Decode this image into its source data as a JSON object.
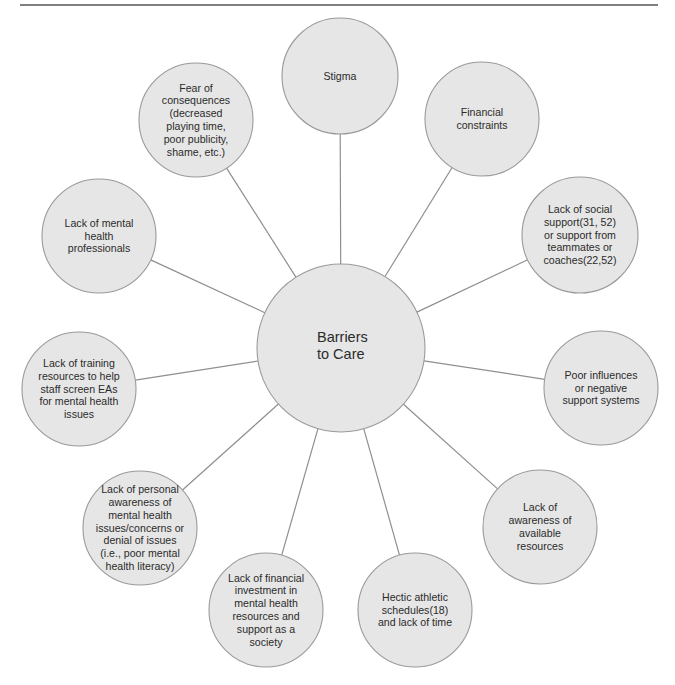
{
  "diagram": {
    "type": "hub-and-spoke",
    "colors": {
      "node_fill": "#e6e6e6",
      "node_stroke": "#9a9a9a",
      "connector": "#8f8f8f",
      "text": "#2b2b2b",
      "rule": "#555555"
    },
    "center": {
      "label_lines": [
        "Barriers",
        "to Care"
      ],
      "cx": 341,
      "cy": 348,
      "r": 84
    },
    "nodes": [
      {
        "id": "stigma",
        "lines": [
          "Stigma"
        ],
        "cx": 340,
        "cy": 76,
        "r": 58
      },
      {
        "id": "financial-constraints",
        "lines": [
          "Financial",
          "constraints"
        ],
        "cx": 482,
        "cy": 119,
        "r": 57
      },
      {
        "id": "social-support",
        "lines": [
          "Lack of social",
          "support(31, 52)",
          "or support from",
          "teammates or",
          "coaches(22,52)"
        ],
        "cx": 580,
        "cy": 235,
        "r": 58
      },
      {
        "id": "poor-influences",
        "lines": [
          "Poor influences",
          "or negative",
          "support systems"
        ],
        "cx": 601,
        "cy": 388,
        "r": 57
      },
      {
        "id": "awareness-resources",
        "lines": [
          "Lack of",
          "awareness of",
          "available",
          "resources"
        ],
        "cx": 540,
        "cy": 527,
        "r": 57
      },
      {
        "id": "hectic-schedules",
        "lines": [
          "Hectic athletic",
          "schedules(18)",
          "and lack of time"
        ],
        "cx": 415,
        "cy": 610,
        "r": 57
      },
      {
        "id": "financial-investment",
        "lines": [
          "Lack of financial",
          "investment in",
          "mental health",
          "resources and",
          "support as a",
          "society"
        ],
        "cx": 266,
        "cy": 610,
        "r": 57
      },
      {
        "id": "personal-awareness",
        "lines": [
          "Lack of personal",
          "awareness of",
          "mental health",
          "issues/concerns or",
          "denial of issues",
          "(i.e., poor mental",
          "health literacy)"
        ],
        "cx": 140,
        "cy": 528,
        "r": 57
      },
      {
        "id": "training-resources",
        "lines": [
          "Lack of training",
          "resources to help",
          "staff screen EAs",
          "for mental health",
          "issues"
        ],
        "cx": 79,
        "cy": 389,
        "r": 57
      },
      {
        "id": "mental-health-professionals",
        "lines": [
          "Lack of mental",
          "health",
          "professionals"
        ],
        "cx": 99,
        "cy": 236,
        "r": 57
      },
      {
        "id": "fear-of-consequences",
        "lines": [
          "Fear of",
          "consequences",
          "(decreased",
          "playing time,",
          "poor publicity,",
          "shame, etc.)"
        ],
        "cx": 196,
        "cy": 120,
        "r": 57
      }
    ]
  }
}
